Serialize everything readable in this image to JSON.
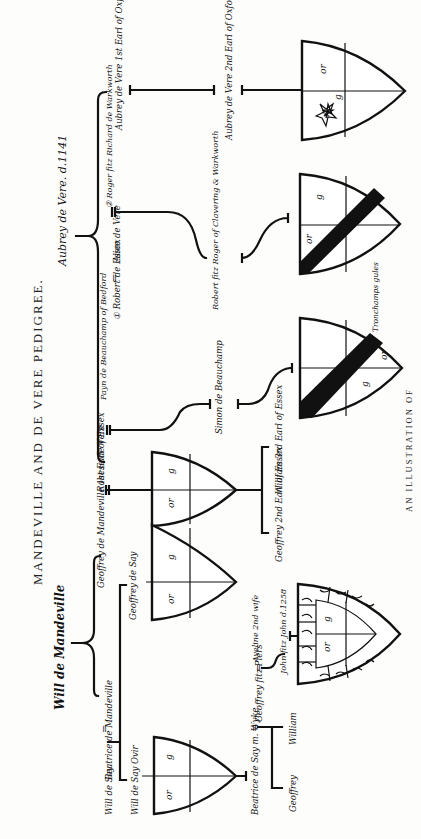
{
  "page": {
    "title": "MANDEVILLE AND DE VERE PEDIGREE.",
    "caption": "AN ILLUSTRATION OF",
    "orientation": "rotated 90° clockwise"
  },
  "pedigree": {
    "root_mandeville": "Will de Mandeville",
    "root_vere": "Aubrey de Vere. d.1141",
    "persons": {
      "beatrice_mandeville": "Beatrice de Mandeville",
      "will_de_say": "Will de Say",
      "will_de_say_junior": "Will de Say Ovir",
      "geoffrey_de_say": "Geoffrey de Say",
      "geoffrey_mandeville": "Geoffrey de Mandeville 1st Earl of Essex",
      "rohese": "Rohese de Vere",
      "payn_beauchamp": "Payn de Beauchamp of Bedford",
      "simon_beauchamp": "Simon de Beauchamp",
      "geoffrey_2nd_earl": "Geoffrey 2nd Earl of Essex",
      "william_3rd_earl": "William 3rd Earl of Essex",
      "aubrey_1st_earl": "Aubrey de Vere 1st Earl of Oxford",
      "aubrey_2nd_earl": "Aubrey de Vere 2nd Earl of Oxford",
      "alice": "Alice de Vere",
      "robert_essex": "① Robert de Essex",
      "roger_fitz_richard": "② Roger fitz Richard de Warkworth",
      "robert_fitz_roger": "Robert fitz Roger of Clavering & Warkworth",
      "beatrice_de_say": "Beatrice de Say m. Wyke",
      "geoffrey_fitz_piers": "Geoffrey fitz Piers",
      "aveline": "Aveline 2nd wife",
      "john_fitz_john": "John fitz John d.1258",
      "william": "William",
      "geoffrey": "Geoffrey"
    },
    "marriage_symbol": "="
  },
  "shields": [
    {
      "id": "de-vere-oxford",
      "tinctures": [
        "or",
        "g"
      ],
      "charge": "mullet argent",
      "label_mark": "A"
    },
    {
      "id": "clavering",
      "tinctures": [
        "or",
        "g"
      ],
      "charge": "bend sable"
    },
    {
      "id": "beauchamp",
      "tinctures": [
        "g",
        "or"
      ],
      "charge": "bend sable",
      "note": "Tronchamps gules"
    },
    {
      "id": "mandeville-essex",
      "tinctures": [
        "g",
        "or"
      ],
      "charge": "quarterly"
    },
    {
      "id": "say-1",
      "tinctures": [
        "g",
        "or"
      ],
      "charge": "quarterly"
    },
    {
      "id": "say-2",
      "tinctures": [
        "g",
        "or"
      ],
      "charge": "quarterly"
    },
    {
      "id": "fitz-john",
      "tinctures": [
        "g",
        "or"
      ],
      "charge": "quarterly, bordure vair"
    }
  ]
}
